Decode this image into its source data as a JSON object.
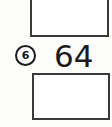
{
  "worksheet": {
    "boxes": [
      {
        "id": "top",
        "content": ""
      },
      {
        "id": "bottom",
        "content": ""
      }
    ],
    "marker": {
      "icon": "circled-number-icon",
      "label": "6"
    },
    "value": "64"
  },
  "colors": {
    "background": "#fdfdfc",
    "box_fill": "#ffffff",
    "box_border": "#3a3a38",
    "ink": "#1a1a1a",
    "marker_border": "#1c1c1c"
  }
}
